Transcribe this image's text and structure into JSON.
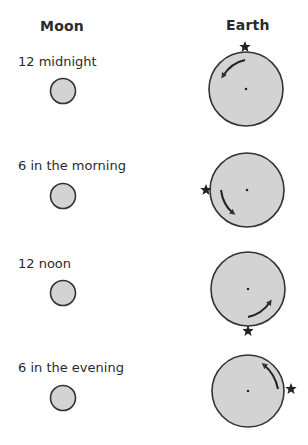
{
  "headers": {
    "moon": "Moon",
    "earth": "Earth"
  },
  "colors": {
    "fill": "#d3d3d3",
    "stroke": "#333333",
    "text": "#2a2a2a"
  },
  "rows": [
    {
      "time_label": "12  midnight",
      "star_position": "top",
      "arrow_direction": "counterclockwise"
    },
    {
      "time_label": "6 in the morning",
      "star_position": "left",
      "arrow_direction": "counterclockwise"
    },
    {
      "time_label": "12 noon",
      "star_position": "bottom",
      "arrow_direction": "counterclockwise"
    },
    {
      "time_label": "6 in the evening",
      "star_position": "right",
      "arrow_direction": "counterclockwise"
    }
  ]
}
